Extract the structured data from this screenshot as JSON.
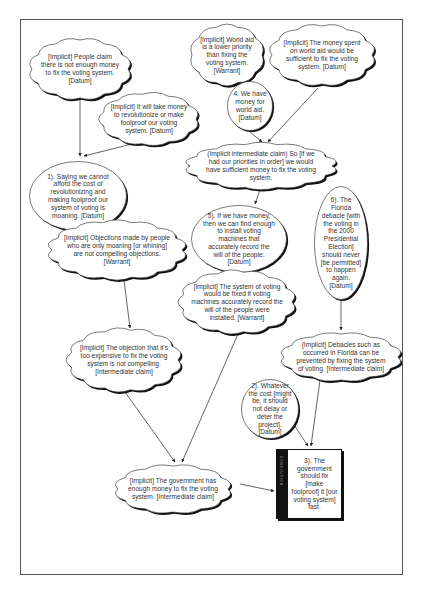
{
  "diagram": {
    "type": "argument-map",
    "nodes": [
      {
        "id": "n1",
        "shape": "cloud",
        "text": "[Implicit] People claim there is not enough money to fix the voting system. [Datum]",
        "box": [
          30,
          38,
          100,
          62
        ]
      },
      {
        "id": "n2",
        "shape": "cloud",
        "text": "[Implicit] World aid is a lower priority than fixing the voting system. [Warrant]",
        "box": [
          190,
          24,
          74,
          62
        ]
      },
      {
        "id": "n3",
        "shape": "cloud",
        "text": "[Implicit] The money spent on world aid would be sufficient to fix the voting system. [Datum]",
        "box": [
          270,
          24,
          104,
          62
        ]
      },
      {
        "id": "n4",
        "shape": "ellipse",
        "text": "4. We have money for world aid. [Datum]",
        "box": [
          226,
          80,
          48,
          52
        ]
      },
      {
        "id": "n5",
        "shape": "cloud",
        "text": "[Implicit] It will take money to revolutionize or make foolproof our voting system. [Datum]",
        "box": [
          100,
          92,
          98,
          54
        ]
      },
      {
        "id": "n6",
        "shape": "cloud",
        "text": "(Implicit intermediate claim) So [if we had our priorities in order] we would have sufficient money to fix the voting system.",
        "box": [
          188,
          142,
          146,
          48
        ]
      },
      {
        "id": "n7",
        "shape": "ellipse",
        "text": "1). Saying we cannot afford the cost of revolutionizing and making foolproof our system of voting is moaning. [Datum]",
        "box": [
          28,
          160,
          100,
          72
        ]
      },
      {
        "id": "n8",
        "shape": "ellipse",
        "text": "5). If we have money, then we can find enough to install voting machines that accurately record the will of the people. [Datum]",
        "box": [
          190,
          204,
          98,
          70
        ]
      },
      {
        "id": "n9",
        "shape": "ellipse",
        "text": "6). The Florida debacle [with the voting in the 2000 Presidential Election] should never [be permitted] to happen again. [Datum]",
        "box": [
          313,
          185,
          56,
          116
        ]
      },
      {
        "id": "n10",
        "shape": "cloud",
        "text": "[Implicit] Objections made by people who are only moaning [or whining] are not compelling objections. [Warrant]",
        "box": [
          50,
          220,
          134,
          60
        ]
      },
      {
        "id": "n11",
        "shape": "cloud",
        "text": "[Implicit] The system of voting would be fixed if voting machines accurately record the will of the people were installed. [Warrant]",
        "box": [
          180,
          270,
          114,
          64
        ]
      },
      {
        "id": "n12",
        "shape": "cloud",
        "text": "[Implicit] The objection that it's too expensive to fix the voting system is not compelling. [Intermediate claim]",
        "box": [
          68,
          328,
          112,
          64
        ]
      },
      {
        "id": "n13",
        "shape": "cloud",
        "text": "[Implicit] Debacles such as occurred in Florida can be prevented by fixing the system of voting. [Intermediate claim]",
        "box": [
          282,
          332,
          118,
          50
        ]
      },
      {
        "id": "n14",
        "shape": "ellipse",
        "text": "2). Whatever the cost [might be, it should not delay or deter the project]. [Datum]",
        "box": [
          240,
          378,
          60,
          62
        ]
      },
      {
        "id": "n15",
        "shape": "cloud",
        "text": "[Implicit] The government has enough money to fix the voting system. [Intermediate claim]",
        "box": [
          116,
          464,
          114,
          50
        ]
      },
      {
        "id": "n16",
        "shape": "claim-box",
        "text": "3). The government should fix [make foolproof] it [our voting system] fast.",
        "box": [
          276,
          449,
          66,
          70
        ]
      }
    ],
    "edges": [
      {
        "from": "n1",
        "to": "n7",
        "points": [
          [
            80,
            100
          ],
          [
            80,
            156
          ]
        ]
      },
      {
        "from": "n5",
        "to": "n7",
        "points": [
          [
            148,
            140
          ],
          [
            84,
            156
          ]
        ]
      },
      {
        "from": "n4",
        "to": "n6",
        "points": [
          [
            250,
            132
          ],
          [
            262,
            142
          ]
        ]
      },
      {
        "from": "n3",
        "to": "n6",
        "points": [
          [
            318,
            88
          ],
          [
            268,
            142
          ]
        ]
      },
      {
        "from": "n6",
        "to": "n8",
        "points": [
          [
            260,
            190
          ],
          [
            255,
            204
          ]
        ]
      },
      {
        "from": "n10",
        "to": "n12",
        "points": [
          [
            124,
            280
          ],
          [
            130,
            328
          ]
        ]
      },
      {
        "from": "n9",
        "to": "n13",
        "points": [
          [
            341,
            301
          ],
          [
            341,
            330
          ]
        ]
      },
      {
        "from": "n12",
        "to": "n15",
        "points": [
          [
            125,
            392
          ],
          [
            175,
            462
          ]
        ]
      },
      {
        "from": "n11",
        "to": "n15",
        "points": [
          [
            238,
            334
          ],
          [
            182,
            462
          ]
        ]
      },
      {
        "from": "n14",
        "to": "n16",
        "points": [
          [
            292,
            422
          ],
          [
            308,
            446
          ]
        ]
      },
      {
        "from": "n13",
        "to": "n16",
        "points": [
          [
            320,
            380
          ],
          [
            311,
            446
          ]
        ]
      },
      {
        "from": "n15",
        "to": "n16",
        "points": [
          [
            240,
            484
          ],
          [
            274,
            491
          ]
        ]
      }
    ],
    "claim_box_tab_label": "CONCLUSION"
  },
  "colors": {
    "text": "#333333",
    "stroke": "#222222",
    "shadow": "#111111",
    "fill": "#ffffff",
    "frame": "#555555"
  }
}
